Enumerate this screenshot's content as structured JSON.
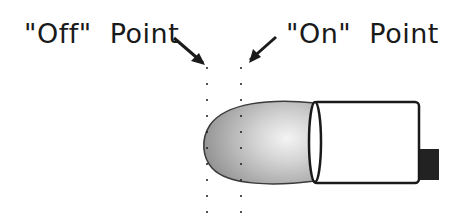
{
  "labels": {
    "off_point": "\"Off\"  Point",
    "on_point": "\"On\"  Point"
  },
  "colors": {
    "ink": "#1a1a1a",
    "bulb_fill_edge": "#9a9a9a",
    "bulb_fill_center": "#f2f2f2",
    "body_fill": "#ffffff",
    "tab_fill": "#222222"
  },
  "markers": {
    "off_line_x": 207,
    "on_line_x": 241
  }
}
